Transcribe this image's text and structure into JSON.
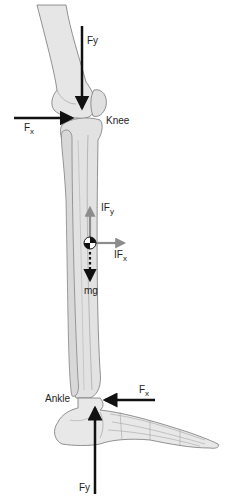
{
  "figure": {
    "background": "#ffffff",
    "colors": {
      "bone_fill": "#e4e4e4",
      "bone_stroke": "#777777",
      "force_arrow": "#111111",
      "inertial_arrow": "#8c8c8c"
    }
  },
  "labels": {
    "knee": "Knee",
    "ankle": "Ankle",
    "knee_fy": {
      "main": "Fy",
      "sub": ""
    },
    "knee_fx": {
      "main": "F",
      "sub": "x"
    },
    "inertial_fy": {
      "main": "IF",
      "sub": "y"
    },
    "inertial_fx": {
      "main": "IF",
      "sub": "x"
    },
    "weight": "mg",
    "ankle_fx": {
      "main": "F",
      "sub": "x"
    },
    "ankle_fy": "Fy"
  },
  "forces": [
    {
      "name": "knee-vertical-force",
      "label": "Fy",
      "direction": "down",
      "style": "solid-black"
    },
    {
      "name": "knee-horizontal-force",
      "label": "Fx",
      "direction": "right",
      "style": "solid-black"
    },
    {
      "name": "inertial-vertical-force",
      "label": "IFy",
      "direction": "up",
      "style": "solid-grey"
    },
    {
      "name": "inertial-horizontal-force",
      "label": "IFx",
      "direction": "right",
      "style": "solid-grey"
    },
    {
      "name": "gravity-force",
      "label": "mg",
      "direction": "down",
      "style": "dotted-black"
    },
    {
      "name": "ankle-horizontal-force",
      "label": "Fx",
      "direction": "left",
      "style": "solid-black"
    },
    {
      "name": "ankle-vertical-force",
      "label": "Fy",
      "direction": "up",
      "style": "solid-black"
    }
  ],
  "markers": [
    {
      "name": "center-of-mass-marker",
      "symbol": "quartered-circle"
    }
  ]
}
